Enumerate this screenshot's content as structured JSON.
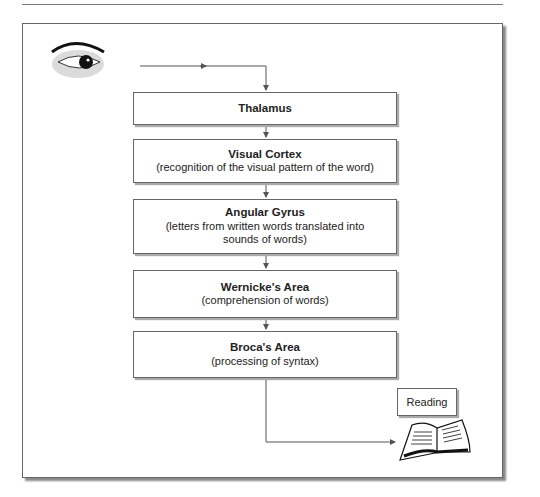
{
  "diagram": {
    "nodes": [
      {
        "id": "eye",
        "label": "",
        "icon": "eye-icon"
      },
      {
        "id": "thalamus",
        "title": "Thalamus",
        "desc": ""
      },
      {
        "id": "visual_cortex",
        "title": "Visual Cortex",
        "desc": "(recognition of the visual pattern of the word)"
      },
      {
        "id": "angular_gyrus",
        "title": "Angular Gyrus",
        "desc": "(letters from written words translated into sounds of words)"
      },
      {
        "id": "wernicke",
        "title": "Wernicke's Area",
        "desc": "(comprehension of words)"
      },
      {
        "id": "broca",
        "title": "Broca's Area",
        "desc": "(processing of syntax)"
      },
      {
        "id": "reading",
        "label": "Reading",
        "icon": "book-icon"
      }
    ],
    "edges": [
      [
        "eye",
        "thalamus"
      ],
      [
        "thalamus",
        "visual_cortex"
      ],
      [
        "visual_cortex",
        "angular_gyrus"
      ],
      [
        "angular_gyrus",
        "wernicke"
      ],
      [
        "wernicke",
        "broca"
      ],
      [
        "broca",
        "reading"
      ]
    ]
  }
}
